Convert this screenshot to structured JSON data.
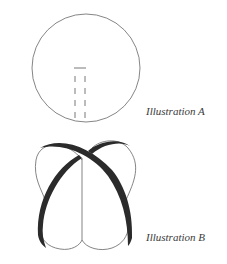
{
  "illustrations": [
    {
      "id": "A",
      "caption": "Illustration A",
      "description": "Circle with a short horizontal line and two vertical dashed lines descending to the bottom edge"
    },
    {
      "id": "B",
      "caption": "Illustration B",
      "description": "Two-lobed heart-like shape with vertical center line and two crossing thick dark bands"
    }
  ],
  "colors": {
    "stroke": "#555555",
    "band": "#2b2b2b",
    "text": "#3a3a3a"
  }
}
